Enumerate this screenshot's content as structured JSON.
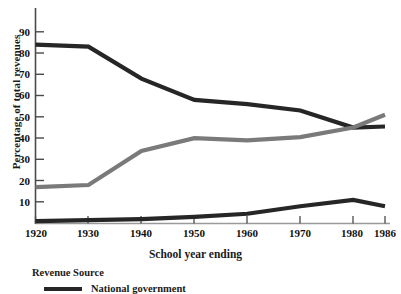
{
  "chart_data": {
    "type": "line",
    "title": "",
    "xlabel": "School year ending",
    "ylabel": "Percentage of total revenues",
    "x": [
      1920,
      1930,
      1940,
      1950,
      1960,
      1970,
      1980,
      1986
    ],
    "categories": [
      "1920",
      "1930",
      "1940",
      "1950",
      "1960",
      "1970",
      "1980",
      "1986"
    ],
    "xlim": [
      1920,
      1986
    ],
    "ylim": [
      0,
      95
    ],
    "yticks": [
      10,
      20,
      30,
      40,
      50,
      60,
      70,
      80,
      90
    ],
    "ytick_labels": [
      "10",
      "20",
      "30",
      "40",
      "50",
      "60",
      "70",
      "80",
      "90"
    ],
    "grid": false,
    "legend_position": "below-left",
    "legend_title": "Revenue Source",
    "series": [
      {
        "name": "Local government",
        "color": "#262626",
        "values": [
          84,
          83,
          68,
          58,
          56,
          53,
          45,
          45.5
        ]
      },
      {
        "name": "State government",
        "color": "#7a7a7a",
        "values": [
          17,
          18,
          34,
          40,
          39,
          40.5,
          45,
          51
        ]
      },
      {
        "name": "National government",
        "color": "#262626",
        "values": [
          1,
          1.5,
          2,
          3,
          4.5,
          8,
          11,
          8
        ]
      }
    ]
  },
  "axis": {
    "y_label": "Percentage of total revenues",
    "x_label": "School year ending",
    "y_ticks": [
      "90",
      "80",
      "70",
      "60",
      "50",
      "40",
      "30",
      "20",
      "10"
    ],
    "x_ticks": [
      "1920",
      "1930",
      "1940",
      "1950",
      "1960",
      "1970",
      "1980",
      "1986"
    ]
  },
  "legend": {
    "title": "Revenue Source",
    "entries": [
      {
        "label": "National government",
        "color": "#262626"
      }
    ]
  }
}
